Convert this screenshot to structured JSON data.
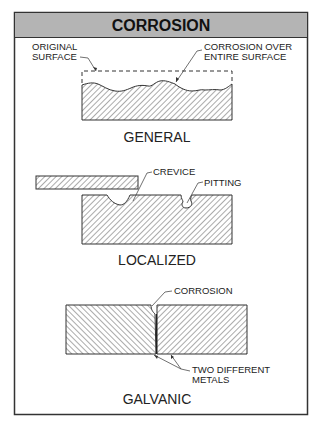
{
  "title": "CORROSION",
  "colors": {
    "header_bg": "#b4b4b4",
    "frame": "#333333",
    "hatch": "#444444",
    "background": "#ffffff"
  },
  "panels": [
    {
      "caption": "GENERAL",
      "labels": {
        "left_line1": "ORIGINAL",
        "left_line2": "SURFACE",
        "right_line1": "CORROSION OVER",
        "right_line2": "ENTIRE SURFACE"
      }
    },
    {
      "caption": "LOCALIZED",
      "labels": {
        "crevice": "CREVICE",
        "pitting": "PITTING"
      }
    },
    {
      "caption": "GALVANIC",
      "labels": {
        "corrosion": "CORROSION",
        "metals_line1": "TWO DIFFERENT",
        "metals_line2": "METALS"
      }
    }
  ]
}
